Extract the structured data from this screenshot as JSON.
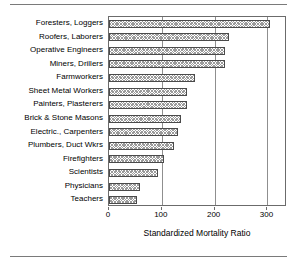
{
  "chart_data": {
    "type": "bar",
    "orientation": "horizontal",
    "title": "",
    "xlabel": "Standardized Mortality Ratio",
    "ylabel": "",
    "xlim": [
      0,
      337
    ],
    "xticks": [
      0,
      100,
      200,
      300
    ],
    "xtick_labels": [
      "0",
      "100",
      "200",
      "300"
    ],
    "grid": "vertical",
    "legend": "none",
    "categories": [
      "Foresters, Loggers",
      "Roofers, Laborers",
      "Operative Engineers",
      "Miners, Drillers",
      "Farmworkers",
      "Sheet Metal Workers",
      "Painters, Plasterers",
      "Brick & Stone Masons",
      "Electric., Carpenters",
      "Plumbers, Duct Wkrs",
      "Firefighters",
      "Scientists",
      "Physicians",
      "Teachers"
    ],
    "values": [
      305,
      227,
      220,
      219,
      163,
      148,
      147,
      137,
      130,
      124,
      105,
      93,
      58,
      53
    ],
    "bar_style": {
      "fill": "crosshatch",
      "fill_color": "#9b9b9b",
      "edge_color": "#4a4a4a"
    }
  },
  "axis": {
    "title": "Standardized Mortality Ratio"
  }
}
